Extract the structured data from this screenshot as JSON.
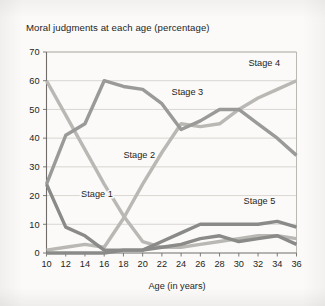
{
  "chart_data": {
    "type": "line",
    "title": "Moral judgments at each age (percentage)",
    "xlabel": "Age (in years)",
    "ylabel": "",
    "x": [
      10,
      12,
      14,
      16,
      18,
      20,
      22,
      24,
      26,
      28,
      30,
      32,
      34,
      36
    ],
    "xlim": [
      10,
      36
    ],
    "ylim": [
      0,
      70
    ],
    "xticks": [
      "10",
      "12",
      "14",
      "16",
      "18",
      "20",
      "22",
      "24",
      "26",
      "28",
      "30",
      "32",
      "34",
      "36"
    ],
    "yticks": [
      "0",
      "10",
      "20",
      "30",
      "40",
      "50",
      "60",
      "70"
    ],
    "grid": true,
    "legend_position": "inline-labels",
    "series": [
      {
        "name": "Stage 1",
        "color": "#8a8a88",
        "label_x": 13.6,
        "label_y": 19.5,
        "values": [
          24,
          9,
          6,
          1,
          1,
          1,
          2,
          3,
          5,
          6,
          4,
          5,
          6,
          3
        ]
      },
      {
        "name": "Stage 2",
        "color": "#9a9a98",
        "label_x": 18.0,
        "label_y": 33.0,
        "values": [
          24,
          41,
          45,
          60,
          58,
          57,
          52,
          43,
          46,
          50,
          50,
          45,
          40,
          34
        ]
      },
      {
        "name": "Stage 3",
        "color": "#b9b8b4",
        "label_x": 23.0,
        "label_y": 55.0,
        "values": [
          60,
          48,
          36,
          24,
          13,
          4,
          2,
          2,
          3,
          4,
          5,
          6,
          6,
          5
        ]
      },
      {
        "name": "Stage 4",
        "color": "#b9b8b4",
        "label_x": 31.0,
        "label_y": 65.0,
        "values": [
          1,
          2,
          3,
          2,
          12,
          24,
          35,
          45,
          44,
          45,
          50,
          54,
          57,
          60
        ]
      },
      {
        "name": "Stage 5",
        "color": "#8a8a88",
        "label_x": 30.5,
        "label_y": 17.0,
        "values": [
          0,
          0,
          0,
          0,
          1,
          1,
          4,
          7,
          10,
          10,
          10,
          10,
          11,
          9
        ]
      }
    ]
  }
}
